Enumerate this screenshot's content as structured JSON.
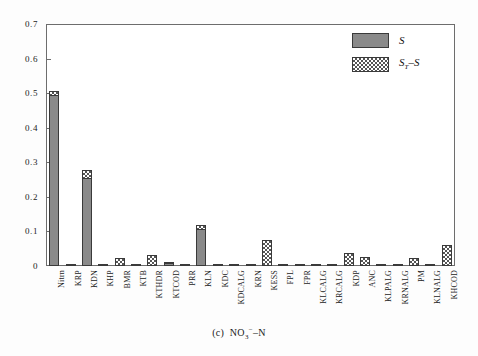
{
  "caption": {
    "index": "(c)",
    "analyte_pre": "NO",
    "analyte_sub": "3",
    "analyte_sup": "−",
    "analyte_post": "–N",
    "full": "(c) NO3− –N"
  },
  "legend": {
    "position": "top-right",
    "entries": [
      {
        "label": "S",
        "pattern": "solid-gray",
        "color": "#8a8a8a"
      },
      {
        "label": "Sᴛ–S",
        "label_main": "S",
        "label_sub": "T",
        "label_tail": "–S",
        "pattern": "checkerboard",
        "color": "#555555"
      }
    ]
  },
  "chart_data": {
    "type": "bar",
    "stacked": true,
    "title": "",
    "xlabel": "",
    "ylabel": "",
    "ylim": [
      0,
      0.7
    ],
    "yticks": [
      0,
      0.1,
      0.2,
      0.3,
      0.4,
      0.5,
      0.6,
      0.7
    ],
    "ytick_labels": [
      "0",
      "0.1",
      "0.2",
      "0.3",
      "0.4",
      "0.5",
      "0.6",
      "0.7"
    ],
    "grid": false,
    "categories": [
      "Nitrn",
      "KRP",
      "KDN",
      "KHP",
      "BMR",
      "KTB",
      "KTHDR",
      "KTCOD",
      "PRR",
      "KLN",
      "KDC",
      "KDCALG",
      "KRN",
      "KESS",
      "FPL",
      "FPR",
      "KLCALG",
      "KRCALG",
      "KDP",
      "ANC",
      "KLPALG",
      "KRNALG",
      "PM",
      "KLNALG",
      "KHCOD"
    ],
    "series": [
      {
        "name": "S",
        "values": [
          0.492,
          0.0,
          0.253,
          0.0,
          0.0,
          0.0,
          0.0,
          0.006,
          0.0,
          0.104,
          0.0,
          0.0,
          0.0,
          0.0,
          0.0,
          0.0,
          0.0,
          0.0,
          0.0,
          0.0,
          0.0,
          0.0,
          0.0,
          0.0,
          0.0
        ]
      },
      {
        "name": "ST-S",
        "values": [
          0.014,
          0.004,
          0.025,
          0.003,
          0.022,
          0.003,
          0.032,
          0.003,
          0.003,
          0.014,
          0.003,
          0.002,
          0.003,
          0.075,
          0.002,
          0.003,
          0.003,
          0.004,
          0.038,
          0.026,
          0.002,
          0.002,
          0.024,
          0.003,
          0.06
        ]
      }
    ],
    "totals": [
      0.506,
      0.004,
      0.278,
      0.003,
      0.022,
      0.003,
      0.032,
      0.009,
      0.003,
      0.118,
      0.003,
      0.002,
      0.003,
      0.075,
      0.002,
      0.003,
      0.003,
      0.004,
      0.038,
      0.026,
      0.002,
      0.002,
      0.024,
      0.003,
      0.06
    ]
  },
  "colors": {
    "bar_solid": "#8a8a8a",
    "bar_checker": "#555555",
    "axis": "#6d6d6d",
    "text": "#1a1a1a",
    "background": "#ffffff"
  }
}
